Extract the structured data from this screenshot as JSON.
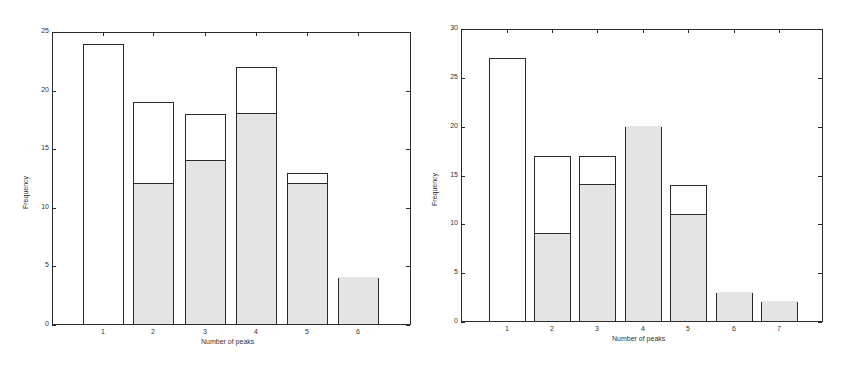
{
  "chart_data": [
    {
      "type": "bar",
      "stacked": true,
      "title": "",
      "xlabel": "Number of peaks",
      "ylabel": "Frequency",
      "categories": [
        "1",
        "2",
        "3",
        "4",
        "5",
        "6"
      ],
      "series": [
        {
          "name": "shaded (lower)",
          "color": "#e4e4e4",
          "values": [
            0,
            12,
            14,
            18,
            12,
            4
          ]
        },
        {
          "name": "white (upper)",
          "color": "#ffffff",
          "values": [
            24,
            7,
            4,
            4,
            1,
            0
          ]
        }
      ],
      "totals": [
        24,
        19,
        18,
        22,
        13,
        4
      ],
      "ylim": [
        0,
        25
      ],
      "yticks": [
        "0",
        "5",
        "10",
        "15",
        "20",
        "25"
      ],
      "grid": false,
      "legend": null
    },
    {
      "type": "bar",
      "stacked": true,
      "title": "",
      "xlabel": "Number of peaks",
      "ylabel": "Frequency",
      "categories": [
        "1",
        "2",
        "3",
        "4",
        "5",
        "6",
        "7"
      ],
      "series": [
        {
          "name": "shaded (lower)",
          "color": "#e4e4e4",
          "values": [
            0,
            9,
            14,
            20,
            11,
            3,
            2
          ]
        },
        {
          "name": "white (upper)",
          "color": "#ffffff",
          "values": [
            27,
            8,
            3,
            0,
            3,
            0,
            0
          ]
        }
      ],
      "totals": [
        27,
        17,
        17,
        20,
        14,
        3,
        2
      ],
      "ylim": [
        0,
        30
      ],
      "yticks": [
        "0",
        "5",
        "10",
        "15",
        "20",
        "25",
        "30"
      ],
      "grid": false,
      "legend": null
    }
  ],
  "layout": [
    {
      "plot": {
        "x": 52,
        "y": 32,
        "w": 359,
        "h": 293
      },
      "centers": [
        103,
        153,
        205,
        256,
        307,
        358
      ],
      "barw": 41,
      "xtitle_x": 201
    },
    {
      "plot": {
        "x": 461,
        "y": 29,
        "w": 362,
        "h": 293
      },
      "centers": [
        507,
        552,
        597,
        643,
        688,
        734,
        779
      ],
      "barw": 37,
      "xtitle_x": 612
    }
  ]
}
